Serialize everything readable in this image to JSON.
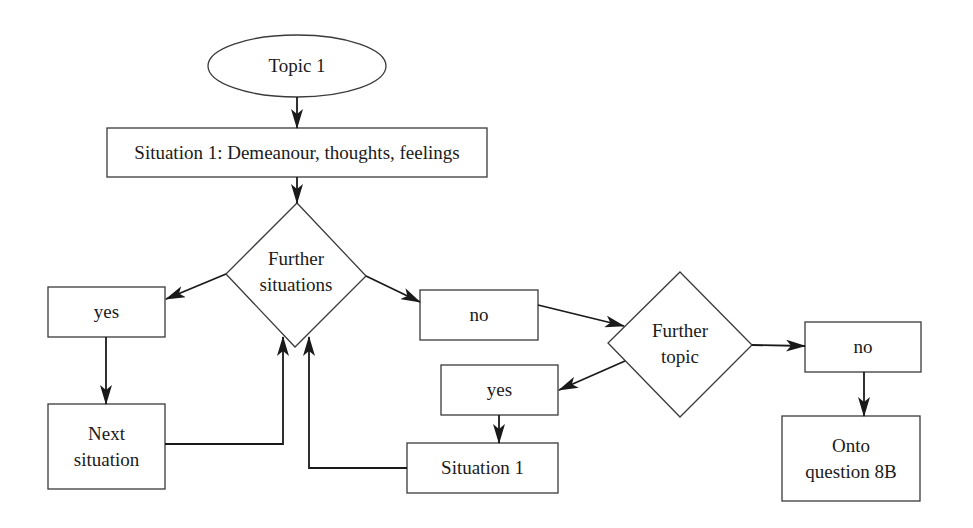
{
  "diagram": {
    "type": "flowchart",
    "nodes": [
      {
        "id": "topic1",
        "shape": "ellipse",
        "label": "Topic 1"
      },
      {
        "id": "situation1_main",
        "shape": "rect",
        "label": "Situation 1: Demeanour, thoughts, feelings"
      },
      {
        "id": "further_situations",
        "shape": "diamond",
        "label_line1": "Further",
        "label_line2": "situations"
      },
      {
        "id": "yes_left",
        "shape": "rect",
        "label": "yes"
      },
      {
        "id": "next_situation",
        "shape": "rect",
        "label_line1": "Next",
        "label_line2": "situation"
      },
      {
        "id": "no_middle",
        "shape": "rect",
        "label": "no"
      },
      {
        "id": "further_topic",
        "shape": "diamond",
        "label_line1": "Further",
        "label_line2": "topic"
      },
      {
        "id": "yes_middle",
        "shape": "rect",
        "label": "yes"
      },
      {
        "id": "situation1_loop",
        "shape": "rect",
        "label": "Situation 1"
      },
      {
        "id": "no_right",
        "shape": "rect",
        "label": "no"
      },
      {
        "id": "onto_question",
        "shape": "rect",
        "label_line1": "Onto",
        "label_line2": "question 8B"
      }
    ],
    "edges": [
      {
        "from": "topic1",
        "to": "situation1_main"
      },
      {
        "from": "situation1_main",
        "to": "further_situations"
      },
      {
        "from": "further_situations",
        "to": "yes_left"
      },
      {
        "from": "further_situations",
        "to": "no_middle"
      },
      {
        "from": "yes_left",
        "to": "next_situation"
      },
      {
        "from": "next_situation",
        "to": "further_situations"
      },
      {
        "from": "no_middle",
        "to": "further_topic"
      },
      {
        "from": "further_topic",
        "to": "yes_middle"
      },
      {
        "from": "further_topic",
        "to": "no_right"
      },
      {
        "from": "yes_middle",
        "to": "situation1_loop"
      },
      {
        "from": "situation1_loop",
        "to": "further_situations"
      },
      {
        "from": "no_right",
        "to": "onto_question"
      }
    ]
  },
  "colors": {
    "stroke": "#2a2a2a",
    "text": "#1a1a1a",
    "background": "#ffffff"
  }
}
